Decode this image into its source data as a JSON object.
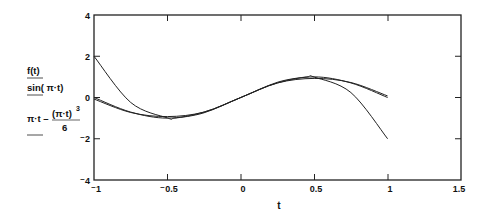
{
  "chart_data": {
    "type": "line",
    "title": "",
    "xlabel": "t",
    "ylabel": "",
    "xlim": [
      -1,
      1.5
    ],
    "ylim": [
      -4,
      4
    ],
    "x_ticks": [
      "-1",
      "-0.5",
      "0",
      "0.5",
      "1",
      "1.5"
    ],
    "y_ticks": [
      "4",
      "2",
      "0",
      "-2",
      "-4"
    ],
    "grid": false,
    "legend_position": "left (stacked y-axis expressions)",
    "series": [
      {
        "name": "f(t)",
        "label_parts": [
          "f(t)"
        ],
        "formula": "not shown in figure",
        "x": [
          -1,
          -0.75,
          -0.5,
          -0.45,
          -0.25,
          0,
          0.25,
          0.45,
          0.5,
          0.75,
          1
        ],
        "values": [
          2.0,
          -0.24,
          -0.99,
          -1.0,
          -0.74,
          0.0,
          0.74,
          1.0,
          0.99,
          0.24,
          -2.0
        ]
      },
      {
        "name": "sin(π·t)",
        "label_parts": [
          "sin( π·t)"
        ],
        "x": [
          -1,
          -0.75,
          -0.5,
          -0.25,
          0,
          0.25,
          0.5,
          0.75,
          1
        ],
        "values": [
          0.0,
          -0.707,
          -1.0,
          -0.707,
          0.0,
          0.707,
          1.0,
          0.707,
          0.0
        ]
      },
      {
        "name": "π·t − (π·t)^3 / 6",
        "label_parts": [
          "π·t −",
          "(π·t)",
          "3",
          "6"
        ],
        "x": [
          -1,
          -0.75,
          -0.5,
          -0.25,
          0,
          0.25,
          0.5,
          0.75,
          1
        ],
        "values": [
          -0.075,
          -0.726,
          -0.925,
          -0.705,
          0.0,
          0.705,
          0.925,
          0.726,
          0.075
        ]
      }
    ]
  },
  "legend": {
    "f_label": "f(t)",
    "sin_label": "sin( π·t)",
    "taylor_left": "π·t –",
    "taylor_num": "(π·t)",
    "taylor_exp": "3",
    "taylor_den": "6"
  },
  "axis": {
    "x_title": "t",
    "x_tick_labels": [
      "⁻1",
      "⁻0.5",
      "0",
      "0.5",
      "1",
      "1.5"
    ],
    "y_tick_labels": [
      "4",
      "2",
      "0",
      "⁻2",
      "⁻4"
    ]
  },
  "colors": {
    "line": "#222222",
    "frame": "#222222",
    "background": "#ffffff"
  }
}
